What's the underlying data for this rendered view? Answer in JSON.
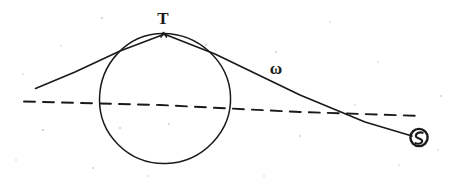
{
  "diagram": {
    "background_color": "#ffffff",
    "ink_color": "#1a1a1a",
    "width": 461,
    "height": 190,
    "labels": {
      "apex": "T",
      "ray": "ω",
      "source": "S"
    },
    "elements": {
      "circle_name": "body-circle",
      "axis_name": "dashed-axis-line",
      "left_ray_name": "left-tangent-line",
      "right_ray_name": "right-tangent-line",
      "source_marker_name": "source-circled-symbol"
    },
    "geometry": {
      "circle_center_x": 165,
      "circle_center_y": 98,
      "circle_radius": 65,
      "apex_x": 163,
      "apex_y": 33,
      "left_ray_start_x": 35,
      "left_ray_start_y": 88,
      "source_x": 418,
      "source_y": 137,
      "axis_y_left": 102,
      "axis_y_right": 116,
      "axis_x_start": 24,
      "axis_x_end": 422
    }
  }
}
